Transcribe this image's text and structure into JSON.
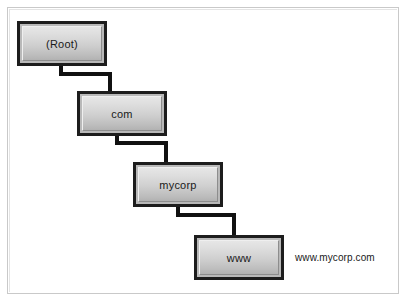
{
  "diagram": {
    "frame_color": "#c9c9c9",
    "node_border_color": "#1d1d1d",
    "connector_color": "#111111",
    "nodes": [
      {
        "id": "root",
        "label": "(Root)"
      },
      {
        "id": "com",
        "label": "com"
      },
      {
        "id": "mycorp",
        "label": "mycorp"
      },
      {
        "id": "www",
        "label": "www"
      }
    ],
    "connectors": [
      {
        "from": "root",
        "to": "com",
        "style": "elbow"
      },
      {
        "from": "com",
        "to": "mycorp",
        "style": "elbow"
      },
      {
        "from": "mycorp",
        "to": "www",
        "style": "elbow"
      }
    ],
    "caption": "www.mycorp.com"
  }
}
